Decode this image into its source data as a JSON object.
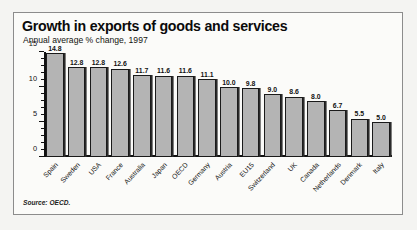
{
  "figure": {
    "title": "Growth in exports of goods and services",
    "subtitle": "Annual average % change, 1997",
    "source": "Source: OECD."
  },
  "chart_data": {
    "type": "bar",
    "title": "Growth in exports of goods and services",
    "subtitle": "Annual average % change, 1997",
    "xlabel": "",
    "ylabel": "",
    "ylim": [
      0,
      15
    ],
    "yticks": [
      0,
      5,
      10,
      15
    ],
    "ytick_labels": [
      "0",
      "5",
      "10",
      "15"
    ],
    "minor_tick_step": 1,
    "grid": false,
    "legend": false,
    "bar_color": "#b4b4b4",
    "bar_edge_color": "#1a1a1a",
    "categories": [
      "Spain",
      "Sweden",
      "USA",
      "France",
      "Australia",
      "Japan",
      "OECD",
      "Germany",
      "Austria",
      "EU15",
      "Switzerland",
      "UK",
      "Canada",
      "Netherlands",
      "Denmark",
      "Italy"
    ],
    "values": [
      14.8,
      12.8,
      12.8,
      12.6,
      11.7,
      11.6,
      11.6,
      11.1,
      10.0,
      9.8,
      9.0,
      8.6,
      8.0,
      6.7,
      5.5,
      5.0
    ],
    "value_labels": [
      "14.8",
      "12.8",
      "12.8",
      "12.6",
      "11.7",
      "11.6",
      "11.6",
      "11.1",
      "10.0",
      "9.8",
      "9.0",
      "8.6",
      "8.0",
      "6.7",
      "5.5",
      "5.0"
    ],
    "source": "Source: OECD."
  }
}
